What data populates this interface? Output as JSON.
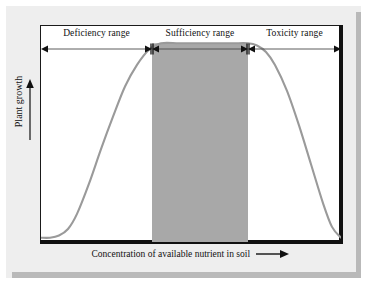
{
  "figure": {
    "caption_present": false,
    "background_color": "#eeeeee",
    "plot_background_color": "#ffffff",
    "frame_color": "#1a1a1a",
    "curve_color": "#9a9a9a",
    "shaded_band_color": "#a8a8a8"
  },
  "axes": {
    "y_title": "Plant growth",
    "y_arrow_icon": "up-arrow-icon",
    "x_title": "Concentration of available nutrient in soil",
    "x_arrow_icon": "right-arrow-icon"
  },
  "ranges": [
    {
      "label": "Deficiency range",
      "start_pct": 0,
      "end_pct": 37
    },
    {
      "label": "Sufficiency range",
      "start_pct": 37,
      "end_pct": 69
    },
    {
      "label": "Toxicity range",
      "start_pct": 69,
      "end_pct": 100
    }
  ],
  "chart_data": {
    "type": "line",
    "title": "",
    "subtitle": "",
    "xlabel": "Concentration of available nutrient in soil",
    "ylabel": "Plant growth",
    "xlim": [
      0,
      100
    ],
    "ylim": [
      0,
      100
    ],
    "grid": false,
    "legend": null,
    "axis_tick_labels": {
      "x": [],
      "y": []
    },
    "annotations": [
      {
        "text": "Deficiency range",
        "x_start_pct": 0,
        "x_end_pct": 37,
        "style": "double-headed-arrow-bracket"
      },
      {
        "text": "Sufficiency range",
        "x_start_pct": 37,
        "x_end_pct": 69,
        "style": "double-headed-arrow-bracket"
      },
      {
        "text": "Toxicity range",
        "x_start_pct": 69,
        "x_end_pct": 100,
        "style": "double-headed-arrow-bracket"
      }
    ],
    "shaded_region": {
      "label": "Sufficiency range",
      "x_start_pct": 37,
      "x_end_pct": 69,
      "y_start_pct": 0,
      "y_end_pct": 92,
      "color": "#a8a8a8"
    },
    "series": [
      {
        "name": "Plant growth response",
        "color": "#9a9a9a",
        "x": [
          0,
          3,
          6,
          9,
          12,
          16,
          20,
          24,
          28,
          32,
          36,
          40,
          46,
          52,
          58,
          64,
          69,
          72,
          75,
          78,
          82,
          86,
          90,
          94,
          97,
          100
        ],
        "y": [
          2,
          2,
          3,
          6,
          13,
          27,
          43,
          58,
          72,
          82,
          89,
          92,
          92,
          92,
          92,
          92,
          92,
          91,
          88,
          82,
          70,
          54,
          36,
          18,
          7,
          2
        ]
      }
    ]
  }
}
